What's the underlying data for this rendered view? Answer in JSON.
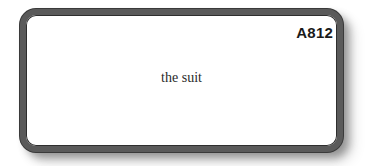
{
  "card": {
    "id": "A812",
    "text": "the suit"
  },
  "colors": {
    "border": "#5a5a5a",
    "background": "#ffffff",
    "text": "#2a2a2a"
  }
}
